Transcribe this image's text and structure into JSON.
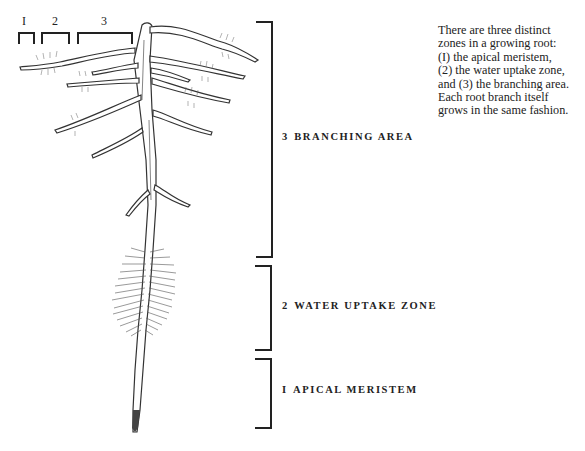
{
  "figure": {
    "type": "root-zones-illustration",
    "top_brackets": [
      {
        "label": "I",
        "x": 19,
        "width": 16
      },
      {
        "label": "2",
        "x": 42,
        "width": 27
      },
      {
        "label": "3",
        "x": 78,
        "width": 55
      }
    ],
    "zones": [
      {
        "id": 3,
        "number": "3",
        "name": "BRANCHING AREA",
        "bracket_top": 22,
        "bracket_bottom": 257,
        "label_y": 137
      },
      {
        "id": 2,
        "number": "2",
        "name": "WATER UPTAKE ZONE",
        "bracket_top": 265,
        "bracket_bottom": 350,
        "label_y": 306
      },
      {
        "id": 1,
        "number": "I",
        "name": "APICAL MERISTEM",
        "bracket_top": 358,
        "bracket_bottom": 428,
        "label_y": 390
      }
    ]
  },
  "caption": {
    "lines": [
      "There are three distinct",
      "zones in a growing root:",
      "(I) the apical meristem,",
      "(2) the water uptake zone,",
      "and (3) the branching area.",
      "Each root branch itself",
      "grows in the same fashion."
    ]
  },
  "colors": {
    "ink": "#222222",
    "background": "#ffffff",
    "hair": "#555555"
  }
}
